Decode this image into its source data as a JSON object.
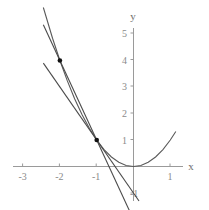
{
  "chart_data": {
    "type": "line",
    "title": "",
    "xlabel": "x",
    "ylabel": "y",
    "xlim": [
      -3.25,
      1.55
    ],
    "ylim": [
      -1.35,
      5.25
    ],
    "grid": false,
    "legend": null,
    "xticks": [
      -3,
      -2,
      -1,
      1
    ],
    "xtick_labels": [
      "-3",
      "-2",
      "-1",
      "1"
    ],
    "yticks": [
      1,
      2,
      3,
      4,
      5
    ],
    "ytick_labels": [
      "1",
      "2",
      "3",
      "4",
      "5"
    ],
    "ytick_negative": [
      -1
    ],
    "ytick_negative_labels": [
      "-1"
    ],
    "series": [
      {
        "name": "parabola",
        "type": "curve",
        "equation": "y = x^2",
        "color": "#5a5a5a",
        "x": [
          -2.45,
          -2.2,
          -2.0,
          -1.8,
          -1.6,
          -1.4,
          -1.2,
          -1.0,
          -0.8,
          -0.6,
          -0.4,
          -0.2,
          0.0,
          0.2,
          0.4,
          0.6,
          0.8,
          1.0,
          1.15
        ],
        "y": [
          6.0,
          4.84,
          4.0,
          3.24,
          2.56,
          1.96,
          1.44,
          1.0,
          0.64,
          0.36,
          0.16,
          0.04,
          0.0,
          0.04,
          0.16,
          0.36,
          0.64,
          1.0,
          1.32
        ]
      },
      {
        "name": "secant-line",
        "type": "line",
        "equation": "y = -3x - 2",
        "color": "#4a4a4a",
        "x": [
          -2.45,
          0.15
        ],
        "y": [
          5.35,
          -2.45
        ]
      },
      {
        "name": "tangent-line",
        "type": "line",
        "equation": "y = -2x - 1",
        "color": "#4a4a4a",
        "x": [
          -2.45,
          0.15
        ],
        "y": [
          3.9,
          -1.3
        ]
      }
    ],
    "points": [
      {
        "name": "point-a",
        "x": -2,
        "y": 4,
        "color": "#111111"
      },
      {
        "name": "point-b",
        "x": -1,
        "y": 1,
        "color": "#111111"
      }
    ],
    "axis_color": "#9a9a9a",
    "tick_color": "#9a9a9a"
  }
}
